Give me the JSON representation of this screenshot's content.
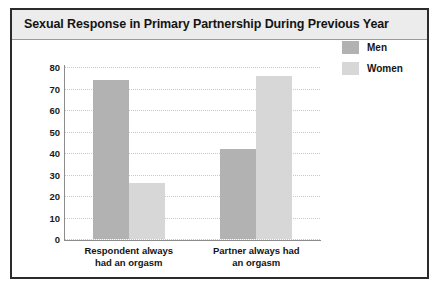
{
  "chart_data": {
    "type": "bar",
    "title": "Sexual Response in Primary Partnership During Previous Year",
    "categories": [
      "Respondent always had an orgasm",
      "Partner always had an orgasm"
    ],
    "category_lines": [
      [
        "Respondent always",
        "had an orgasm"
      ],
      [
        "Partner always had",
        "an orgasm"
      ]
    ],
    "series": [
      {
        "name": "Men",
        "color": "#b2b2b2",
        "values": [
          74,
          42
        ]
      },
      {
        "name": "Women",
        "color": "#d7d7d7",
        "values": [
          26,
          76
        ]
      }
    ],
    "xlabel": "",
    "ylabel": "",
    "ylim": [
      0,
      80
    ],
    "ytick_step": 10,
    "yticks": [
      80,
      70,
      60,
      50,
      40,
      30,
      20,
      10,
      0
    ],
    "grid": true,
    "grid_style": "dotted",
    "legend_position": "top-right",
    "legend": [
      "Men",
      "Women"
    ]
  },
  "figure": {
    "border_color": "#2b2b2b",
    "title_band_color": "#ececec",
    "background": "#ffffff",
    "axis_color": "#8c8c8c",
    "grid_color": "#c9c9c9"
  }
}
